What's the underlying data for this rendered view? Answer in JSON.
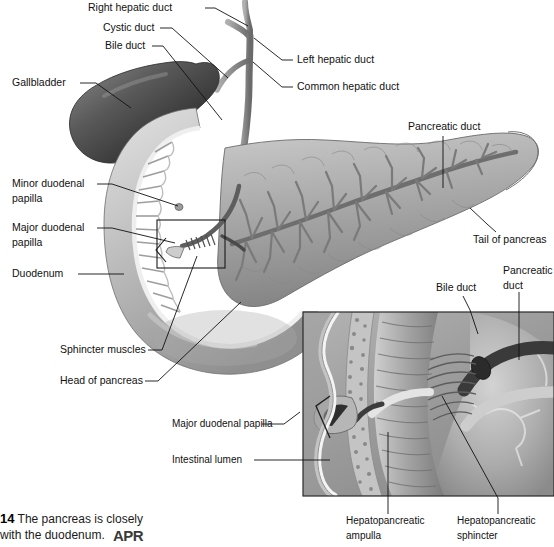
{
  "figure": {
    "number": "14",
    "caption_line1": "The pancreas is closely",
    "caption_line2": "with the duodenum.",
    "logo": "APR"
  },
  "colors": {
    "ink": "#111111",
    "duodenum_light": "#cfcfcf",
    "duodenum_mid": "#a8a8a8",
    "duodenum_dark": "#7d7d7d",
    "gallbladder_dark": "#3f3f3f",
    "gallbladder_mid": "#6e6e6e",
    "pancreas_light": "#c6c6c6",
    "pancreas_mid": "#9a9a9a",
    "pancreas_dark": "#6f6f6f",
    "duct_gray": "#8a8a8a",
    "mucosa_white": "#f2f2f2",
    "inset_bg": "#a6a6a6",
    "background": "#ffffff"
  },
  "main_labels": [
    {
      "id": "right-hepatic-duct",
      "text": "Right hepatic duct",
      "x": 88,
      "y": 8,
      "anchor": "start"
    },
    {
      "id": "cystic-duct",
      "text": "Cystic duct",
      "x": 103,
      "y": 28,
      "anchor": "start"
    },
    {
      "id": "bile-duct",
      "text": "Bile duct",
      "x": 105,
      "y": 46,
      "anchor": "start"
    },
    {
      "id": "left-hepatic-duct",
      "text": "Left hepatic duct",
      "x": 297,
      "y": 60,
      "anchor": "start"
    },
    {
      "id": "common-hepatic-duct",
      "text": "Common hepatic duct",
      "x": 297,
      "y": 87,
      "anchor": "start"
    },
    {
      "id": "gallbladder",
      "text": "Gallbladder",
      "x": 12,
      "y": 83,
      "anchor": "start"
    },
    {
      "id": "pancreatic-duct-main",
      "text": "Pancreatic duct",
      "x": 408,
      "y": 127,
      "anchor": "start"
    },
    {
      "id": "tail-of-pancreas",
      "text": "Tail of pancreas",
      "x": 473,
      "y": 240,
      "anchor": "start"
    },
    {
      "id": "duodenum",
      "text": "Duodenum",
      "x": 12,
      "y": 274,
      "anchor": "start"
    },
    {
      "id": "sphincter-muscles",
      "text": "Sphincter muscles",
      "x": 60,
      "y": 350,
      "anchor": "start"
    },
    {
      "id": "head-of-pancreas",
      "text": "Head of pancreas",
      "x": 60,
      "y": 381,
      "anchor": "start"
    }
  ],
  "main_labels_two_line": [
    {
      "id": "minor-duodenal-papilla",
      "line1": "Minor duodenal",
      "line2": "papilla",
      "x": 12,
      "y": 184
    },
    {
      "id": "major-duodenal-papilla",
      "line1": "Major duodenal",
      "line2": "papilla",
      "x": 12,
      "y": 228
    }
  ],
  "inset_labels": [
    {
      "id": "inset-bile-duct",
      "text": "Bile duct",
      "x": 436,
      "y": 288,
      "anchor": "start"
    },
    {
      "id": "inset-major-duodenal-papilla",
      "text": "Major duodenal papilla",
      "x": 172,
      "y": 424,
      "anchor": "start"
    },
    {
      "id": "inset-intestinal-lumen",
      "text": "Intestinal lumen",
      "x": 172,
      "y": 460,
      "anchor": "start"
    }
  ],
  "inset_labels_two_line": [
    {
      "id": "inset-pancreatic-duct",
      "line1": "Pancreatic",
      "line2": "duct",
      "x": 503,
      "y": 278
    },
    {
      "id": "inset-hepatopancreatic-ampulla",
      "line1": "Hepatopancreatic",
      "line2": "ampulla",
      "x": 346,
      "y": 523
    },
    {
      "id": "inset-hepatopancreatic-sphincter",
      "line1": "Hepatopancreatic",
      "line2": "sphincter",
      "x": 457,
      "y": 523
    }
  ],
  "leaders": [
    {
      "id": "leader-right-hepatic-duct",
      "d": "M 205 8 L 215 8 L 248 26"
    },
    {
      "id": "leader-cystic-duct",
      "d": "M 160 28 L 172 28 L 228 78"
    },
    {
      "id": "leader-bile-duct",
      "d": "M 152 46 L 163 46 L 222 120"
    },
    {
      "id": "leader-left-hepatic-duct",
      "d": "M 293 60 L 282 60 L 254 38"
    },
    {
      "id": "leader-common-hepatic-duct",
      "d": "M 293 87 L 282 87 L 253 62"
    },
    {
      "id": "leader-gallbladder",
      "d": "M 80 83 L 96 83 L 131 108"
    },
    {
      "id": "leader-pancreatic-duct-main",
      "d": "M 443 136 L 443 188"
    },
    {
      "id": "leader-tail-of-pancreas",
      "d": "M 496 232 L 487 224 L 470 208"
    },
    {
      "id": "leader-minor-papilla",
      "d": "M 97 184 L 112 184 L 178 206"
    },
    {
      "id": "leader-major-papilla",
      "d": "M 97 228 L 112 228 L 175 243"
    },
    {
      "id": "leader-duodenum",
      "d": "M 78 274 L 124 274"
    },
    {
      "id": "leader-sphincter-muscles",
      "d": "M 148 350 L 162 350 L 197 256"
    },
    {
      "id": "leader-head-of-pancreas",
      "d": "M 145 381 L 158 381 L 241 302"
    },
    {
      "id": "leader-inset-bile-duct",
      "d": "M 463 296 L 470 310 L 478 334"
    },
    {
      "id": "leader-inset-pancreatic-duct",
      "d": "M 519 292 L 519 360"
    },
    {
      "id": "leader-inset-major-papilla",
      "d": "M 262 424 L 284 424 L 300 412"
    },
    {
      "id": "leader-inset-intestinal-lumen",
      "d": "M 254 460 L 330 460"
    },
    {
      "id": "leader-inset-ampulla",
      "d": "M 388 514 L 388 432"
    },
    {
      "id": "leader-inset-sphincter",
      "d": "M 498 514 L 498 498 L 442 396"
    }
  ],
  "callout_box": {
    "x": 157,
    "y": 220,
    "width": 68,
    "height": 48
  },
  "inset_frame": {
    "x": 303,
    "y": 312,
    "width": 251,
    "height": 184
  }
}
